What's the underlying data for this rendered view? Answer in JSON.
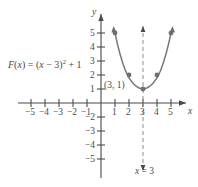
{
  "figure": {
    "equation_label": "F(x) = (x − 3)² + 1",
    "vertex_label": "(3, 1)",
    "axis_of_symmetry_label": "x = 3",
    "x_axis_name": "x",
    "y_axis_name": "y",
    "curve_color": "#7a7a7a",
    "axis_color": "#4a4a4a",
    "background_color": "#ffffff"
  },
  "chart_data": {
    "type": "line",
    "xlabel": "x",
    "ylabel": "y",
    "xlim": [
      -6,
      6
    ],
    "ylim": [
      -6,
      6
    ],
    "grid": false,
    "legend": "none",
    "function": "F(x) = (x - 3)^2 + 1",
    "vertex": [
      3,
      1
    ],
    "axis_of_symmetry": 3,
    "x_ticks": [
      -5,
      -4,
      -3,
      -2,
      -1,
      1,
      2,
      3,
      4,
      5
    ],
    "y_ticks": [
      -5,
      -4,
      -3,
      -2,
      1,
      2,
      3,
      4,
      5
    ],
    "x_tick_labels": [
      "−5",
      "−4",
      "−3",
      "−2",
      "−1",
      "1",
      "2",
      "3",
      "4",
      "5"
    ],
    "y_tick_labels": [
      "−5",
      "−4",
      "−3",
      "−2",
      "1",
      "2",
      "3",
      "4",
      "5"
    ],
    "marked_points": [
      {
        "x": 1,
        "y": 5
      },
      {
        "x": 2,
        "y": 2
      },
      {
        "x": 3,
        "y": 1
      },
      {
        "x": 4,
        "y": 2
      },
      {
        "x": 5,
        "y": 5
      }
    ],
    "series": [
      {
        "name": "F(x) = (x − 3)² + 1",
        "x": [
          0.8,
          1.0,
          1.5,
          2.0,
          2.5,
          3.0,
          3.5,
          4.0,
          4.5,
          5.0,
          5.2
        ],
        "values": [
          5.84,
          5.0,
          3.25,
          2.0,
          1.25,
          1.0,
          1.25,
          2.0,
          3.25,
          5.0,
          5.84
        ]
      }
    ],
    "annotations": [
      {
        "text": "(3, 1)",
        "x": 3,
        "y": 1,
        "role": "vertex"
      },
      {
        "text": "x = 3",
        "x": 3,
        "y": -5.2,
        "role": "axis-of-symmetry"
      },
      {
        "text": "F(x) = (x − 3)² + 1",
        "x": -5.5,
        "y": 2.5,
        "role": "function-label"
      }
    ]
  },
  "x_tick_positions": [
    {
      "label": "−5",
      "left": 25,
      "top": 108
    },
    {
      "label": "−4",
      "left": 39,
      "top": 108
    },
    {
      "label": "−3",
      "left": 53,
      "top": 108
    },
    {
      "label": "−2",
      "left": 67,
      "top": 108
    },
    {
      "label": "−1",
      "left": 81,
      "top": 108
    },
    {
      "label": "1",
      "left": 112,
      "top": 108
    },
    {
      "label": "2",
      "left": 126,
      "top": 108
    },
    {
      "label": "3",
      "left": 140,
      "top": 108
    },
    {
      "label": "4",
      "left": 154,
      "top": 108
    },
    {
      "label": "5",
      "left": 168,
      "top": 108
    }
  ],
  "y_tick_positions": [
    {
      "label": "5",
      "left": 90,
      "top": 29
    },
    {
      "label": "4",
      "left": 90,
      "top": 43
    },
    {
      "label": "3",
      "left": 90,
      "top": 57
    },
    {
      "label": "2",
      "left": 90,
      "top": 71
    },
    {
      "label": "1",
      "left": 90,
      "top": 85
    },
    {
      "label": "−2",
      "left": 85,
      "top": 113
    },
    {
      "label": "−3",
      "left": 85,
      "top": 127
    },
    {
      "label": "−4",
      "left": 85,
      "top": 141
    },
    {
      "label": "−5",
      "left": 85,
      "top": 155
    }
  ]
}
